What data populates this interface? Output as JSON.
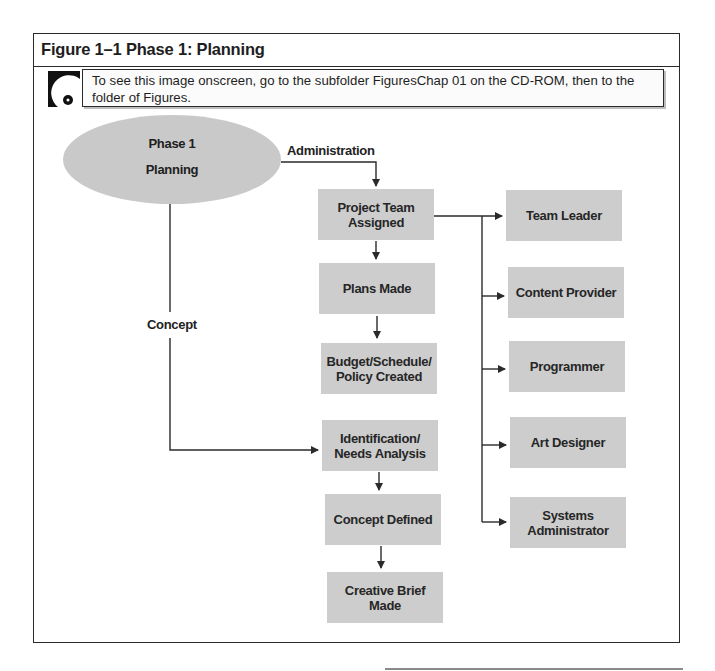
{
  "figure": {
    "title": "Figure 1–1 Phase 1: Planning",
    "note_icon": "cd-rom-icon",
    "note_text": "To see this image onscreen, go to the subfolder FiguresChap 01 on the CD-ROM, then to the folder of Figures."
  },
  "diagram": {
    "root": {
      "line1": "Phase 1",
      "line2": "Planning"
    },
    "branch_labels": {
      "administration": "Administration",
      "concept": "Concept"
    },
    "administration_flow": [
      "Project Team\nAssigned",
      "Plans Made",
      "Budget/Schedule/\nPolicy Created"
    ],
    "concept_flow": [
      "Identification/\nNeeds Analysis",
      "Concept Defined",
      "Creative Brief\nMade"
    ],
    "team_roles": [
      "Team Leader",
      "Content Provider",
      "Programmer",
      "Art Designer",
      "Systems\nAdministrator"
    ],
    "colors": {
      "box_fill": "#cdcdcd",
      "ellipse_fill": "#c9c9c9",
      "line": "#2a2a2a"
    }
  }
}
